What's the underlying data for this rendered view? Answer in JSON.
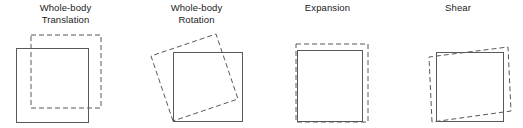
{
  "figure": {
    "width": 523,
    "height": 128,
    "background_color": "#ffffff",
    "stroke_color": "#595959",
    "label_color": "#1a1a1a"
  },
  "panels": [
    {
      "id": "whole-body-translation",
      "label": "Whole-body\nTranslation",
      "label_line1": "Whole-body",
      "label_line2": "Translation",
      "left": 0,
      "width": 131,
      "reference_square": {
        "x": 16,
        "y": 48,
        "width": 72,
        "height": 74
      },
      "transformed_shape": {
        "type": "square",
        "style": "dashed",
        "points": "31,35 101,35 101,108 31,108"
      }
    },
    {
      "id": "whole-body-rotation",
      "label": "Whole-body\nRotation",
      "label_line1": "Whole-body",
      "label_line2": "Rotation",
      "left": 131,
      "width": 131,
      "reference_square": {
        "x": 173,
        "y": 52,
        "width": 69,
        "height": 69
      },
      "transformed_shape": {
        "type": "rotated-square",
        "style": "dashed",
        "rotation_degrees": 20,
        "points": "173,121 151,56 216,34 238,99"
      }
    },
    {
      "id": "expansion",
      "label": "Expansion",
      "label_line1": "Expansion",
      "label_line2": "",
      "left": 262,
      "width": 131,
      "reference_square": {
        "x": 297,
        "y": 50,
        "width": 65,
        "height": 71
      },
      "transformed_shape": {
        "type": "square",
        "style": "dashed",
        "points": "296,44 368,44 368,122 296,122"
      }
    },
    {
      "id": "shear",
      "label": "Shear",
      "label_line1": "Shear",
      "label_line2": "",
      "left": 393,
      "width": 130,
      "reference_square": {
        "x": 436,
        "y": 52,
        "width": 67,
        "height": 69
      },
      "transformed_shape": {
        "type": "sheared-quad",
        "style": "dashed",
        "points": "432,122 429,57 508,47 511,111"
      }
    }
  ]
}
